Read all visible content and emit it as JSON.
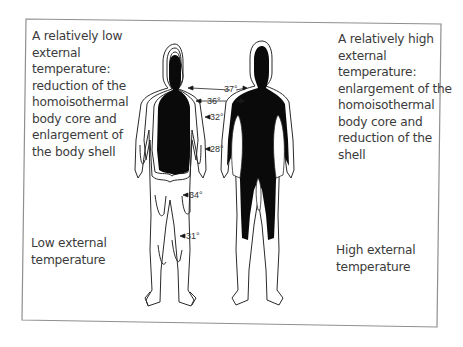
{
  "figure": {
    "left_panel": {
      "description_lines": [
        "A relatively low",
        "external",
        "temperature:",
        "reduction of the",
        "homoisothermal",
        "body core and",
        "enlargement of",
        "the body shell"
      ],
      "label_lines": [
        "Low external",
        "temperature"
      ]
    },
    "right_panel": {
      "description_lines": [
        "A relatively high",
        "external",
        "temperature:",
        "enlargement of the",
        "homoisothermal",
        "body core and",
        "reduction of the",
        "shell"
      ],
      "label_lines": [
        "High external",
        "temperature"
      ]
    },
    "isotherms": [
      {
        "label": "37°"
      },
      {
        "label": "36°"
      },
      {
        "label": "32°"
      },
      {
        "label": "28°"
      },
      {
        "label": "34°"
      },
      {
        "label": "31°"
      }
    ],
    "colors": {
      "core": "#0a0a0a",
      "outline": "#2a2a2a",
      "border": "#8a8a8a",
      "text": "#3b3b3b"
    }
  }
}
